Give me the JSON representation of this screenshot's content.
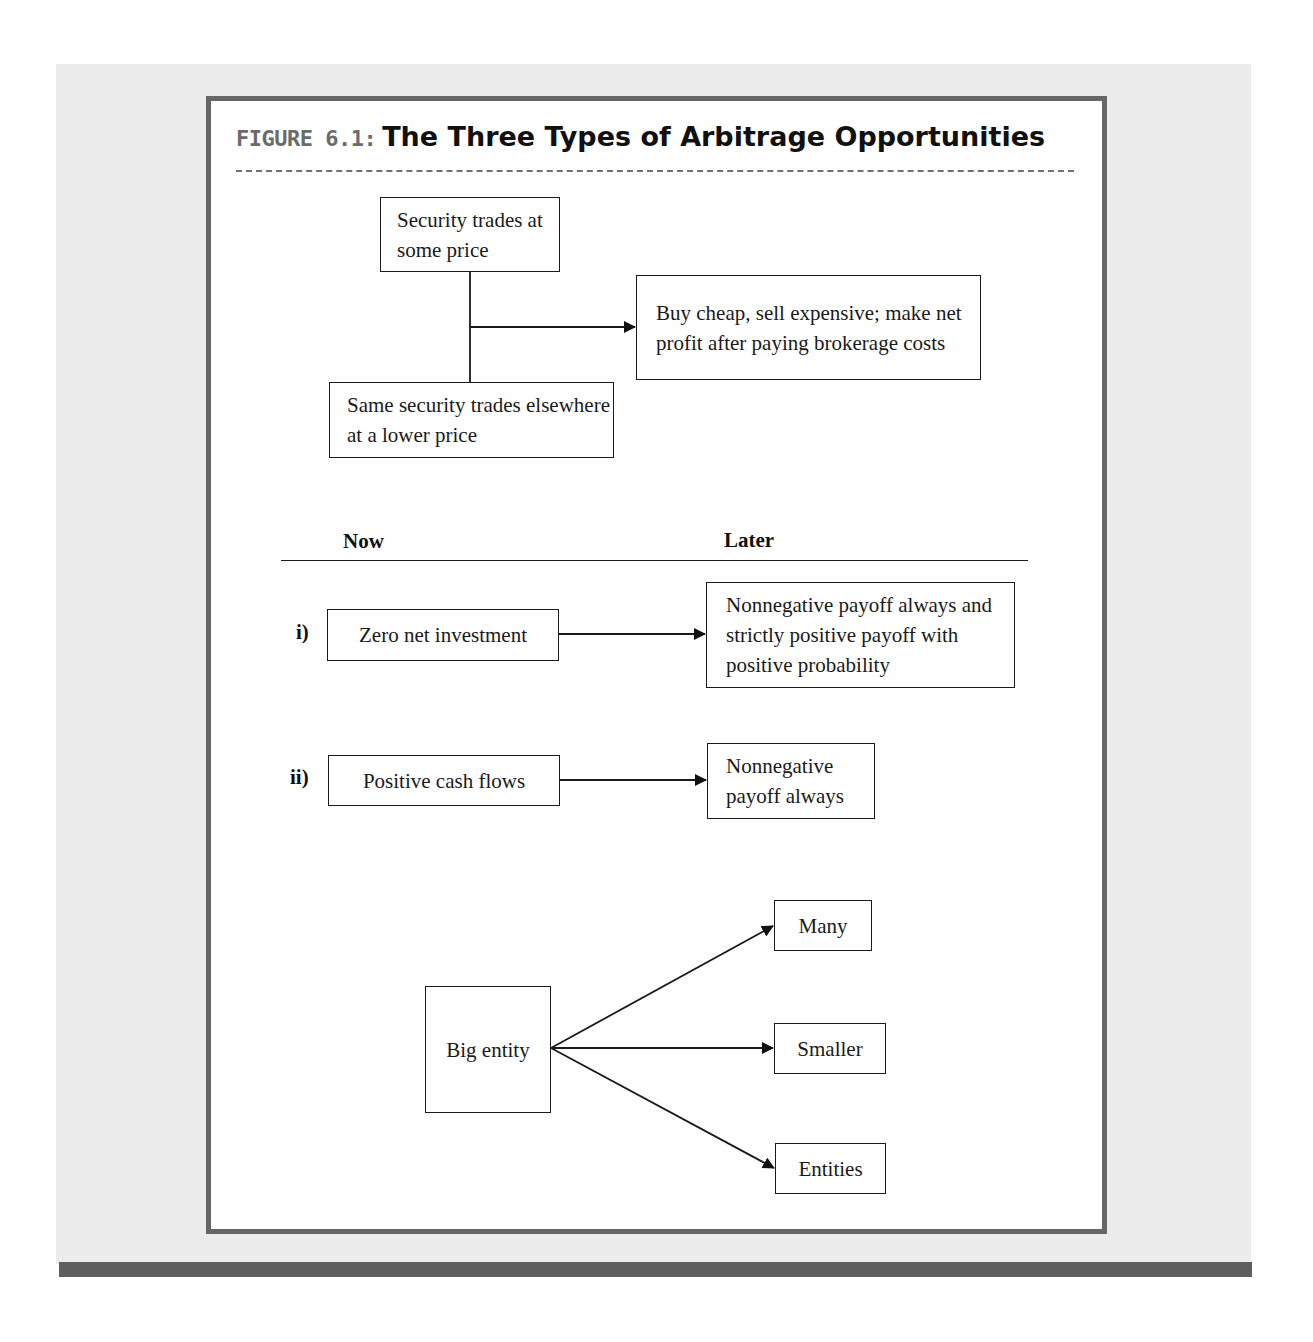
{
  "figure": {
    "label": "FIGURE 6.1:",
    "title": "The Three Types of Arbitrage Opportunities",
    "colors": {
      "panel_background": "#ececec",
      "frame_border": "#666666",
      "bottom_bar": "#5e5e5e",
      "label_gray": "#6b6b6b",
      "ink": "#1a1a1a"
    }
  },
  "section1": {
    "box_top": "Security trades at some price",
    "box_bottom": "Same security trades elsewhere at a lower price",
    "box_result": "Buy cheap, sell expensive; make net profit after paying brokerage costs"
  },
  "section2": {
    "headers": {
      "now": "Now",
      "later": "Later"
    },
    "rows": [
      {
        "label": "i)",
        "now": "Zero net investment",
        "later": "Nonnegative payoff always and strictly positive payoff with positive probability"
      },
      {
        "label": "ii)",
        "now": "Positive cash flows",
        "later": "Nonnegative payoff always"
      }
    ]
  },
  "section3": {
    "source": "Big entity",
    "targets": [
      "Many",
      "Smaller",
      "Entities"
    ]
  }
}
